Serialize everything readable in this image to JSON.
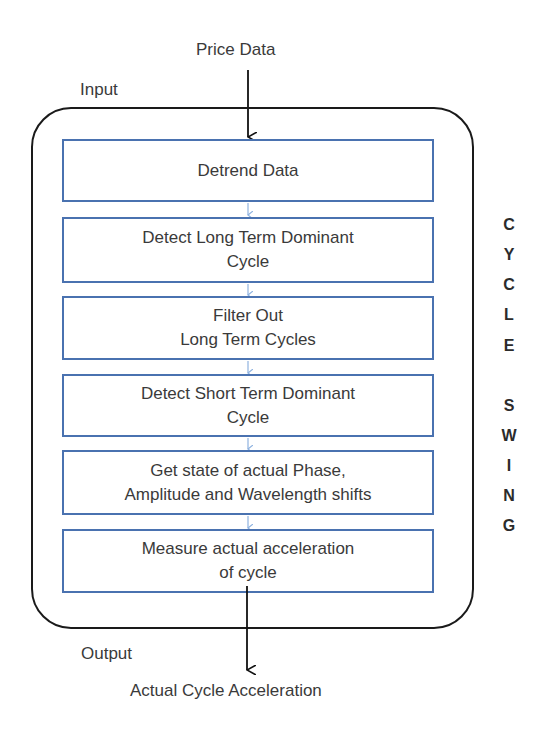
{
  "diagram": {
    "input_source": "Price Data",
    "input_label": "Input",
    "output_label": "Output",
    "output_result": "Actual Cycle Acceleration",
    "steps": [
      {
        "line1": "Detrend Data",
        "line2": ""
      },
      {
        "line1": "Detect Long Term Dominant",
        "line2": "Cycle"
      },
      {
        "line1": "Filter Out",
        "line2": "Long Term Cycles"
      },
      {
        "line1": "Detect Short Term Dominant",
        "line2": "Cycle"
      },
      {
        "line1": "Get state of actual Phase,",
        "line2": "Amplitude and Wavelength shifts"
      },
      {
        "line1": "Measure actual acceleration",
        "line2": "of cycle"
      }
    ],
    "side_title": [
      "C",
      "Y",
      "C",
      "L",
      "E",
      "S",
      "W",
      "I",
      "N",
      "G"
    ],
    "side_title_text": "CYCLE SWING",
    "colors": {
      "box_border": "#4a72b0",
      "connector": "#8fb3e0",
      "outer": "#1a1a1a"
    }
  }
}
